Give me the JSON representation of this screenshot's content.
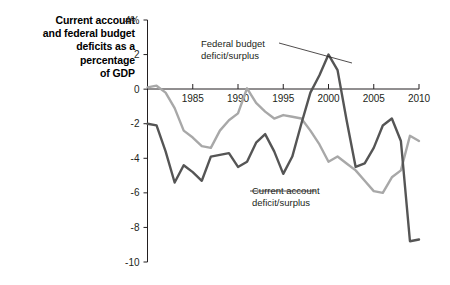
{
  "chart_data": {
    "type": "line",
    "title": "Current account and federal budget deficits as a percentage of GDP",
    "title_lines": [
      "Current account",
      "and federal budget",
      "deficits as a",
      "percentage",
      "of GDP"
    ],
    "xlabel": "",
    "ylabel": "",
    "ylim": [
      -10,
      4
    ],
    "xlim": [
      1980,
      2010
    ],
    "y_ticks": [
      4,
      2,
      0,
      -2,
      -4,
      -6,
      -8,
      -10
    ],
    "y_tick_labels": [
      "4%",
      "2",
      "0",
      "-2",
      "-4",
      "-6",
      "-8",
      "-10"
    ],
    "x_ticks": [
      1985,
      1990,
      1995,
      2000,
      2005,
      2010
    ],
    "x_tick_labels": [
      "1985",
      "1990",
      "1995",
      "2000",
      "2005",
      "2010"
    ],
    "grid": false,
    "legend_position": "annotations",
    "annotations": [
      {
        "id": "federal",
        "lines": [
          "Federal budget",
          "deficit/surplus"
        ],
        "text": "Federal budget deficit/surplus",
        "points_to_year": 2000,
        "points_to_value": 2.0
      },
      {
        "id": "current",
        "lines": [
          "Current account",
          "deficit/surplus"
        ],
        "text": "Current account deficit/surplus",
        "points_to_year": 2006,
        "points_to_value": -6.0
      }
    ],
    "series": [
      {
        "name": "Federal budget deficit/surplus",
        "color": "#555555",
        "x": [
          1980,
          1981,
          1982,
          1983,
          1984,
          1985,
          1986,
          1987,
          1988,
          1989,
          1990,
          1991,
          1992,
          1993,
          1994,
          1995,
          1996,
          1997,
          1998,
          1999,
          2000,
          2001,
          2002,
          2003,
          2004,
          2005,
          2006,
          2007,
          2008,
          2009,
          2010
        ],
        "values": [
          -2.0,
          -2.1,
          -3.6,
          -5.4,
          -4.4,
          -4.8,
          -5.3,
          -3.9,
          -3.8,
          -3.7,
          -4.5,
          -4.2,
          -3.1,
          -2.6,
          -3.6,
          -4.9,
          -3.9,
          -2.0,
          -0.2,
          0.8,
          2.0,
          1.1,
          -1.8,
          -4.5,
          -4.3,
          -3.4,
          -2.1,
          -1.7,
          -3.0,
          -8.8,
          -8.7
        ]
      },
      {
        "name": "Current account deficit/surplus",
        "color": "#a8a8a8",
        "x": [
          1980,
          1981,
          1982,
          1983,
          1984,
          1985,
          1986,
          1987,
          1988,
          1989,
          1990,
          1991,
          1992,
          1993,
          1994,
          1995,
          1996,
          1997,
          1998,
          1999,
          2000,
          2001,
          2002,
          2003,
          2004,
          2005,
          2006,
          2007,
          2008,
          2009,
          2010
        ],
        "values": [
          0.1,
          0.2,
          -0.2,
          -1.1,
          -2.4,
          -2.8,
          -3.3,
          -3.4,
          -2.4,
          -1.8,
          -1.4,
          0.05,
          -0.8,
          -1.3,
          -1.7,
          -1.5,
          -1.6,
          -1.7,
          -2.4,
          -3.2,
          -4.2,
          -3.9,
          -4.3,
          -4.7,
          -5.3,
          -5.9,
          -6.0,
          -5.1,
          -4.7,
          -2.7,
          -3.0
        ]
      }
    ]
  }
}
